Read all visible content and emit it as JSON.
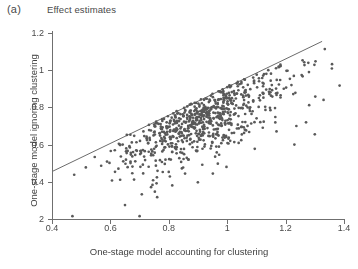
{
  "panel": {
    "label": "(a)",
    "title": "Effect estimates"
  },
  "axes": {
    "x": {
      "title": "One-stage model accounting for clustering",
      "ticks": [
        "0.4",
        "0.6",
        "0.8",
        "1",
        "1.2",
        "1.4"
      ],
      "tick_values": [
        0.4,
        0.6,
        0.8,
        1.0,
        1.2,
        1.4
      ],
      "min": 0.4,
      "max": 1.4
    },
    "y": {
      "title": "One-stage model ignoring clustering",
      "ticks": [
        "1.2",
        "1",
        "0.8",
        "0.6",
        "0.4",
        "2"
      ],
      "tick_values": [
        1.2,
        1.0,
        0.8,
        0.6,
        0.4,
        0.2
      ],
      "min": 0.2,
      "max": 1.2
    }
  },
  "style": {
    "point_color": "#595959",
    "point_radius": 1.35,
    "line_color": "#5a5a5a",
    "axis_color": "#6f6f6f",
    "background": "#ffffff"
  },
  "chart_data": {
    "type": "scatter",
    "title": "Effect estimates",
    "xlabel": "One-stage model accounting for clustering",
    "ylabel": "One-stage model ignoring clustering",
    "xlim": [
      0.4,
      1.4
    ],
    "ylim": [
      0.2,
      1.2
    ],
    "grid": false,
    "legend": null,
    "n_points": 760,
    "reference_line": {
      "label": "identity-like reference line",
      "x_start": 0.4,
      "y_start": 0.455,
      "x_end": 1.325,
      "y_end": 1.155
    },
    "cloud_description": {
      "shape": "dense elongated cluster along and below the reference line, fanning out to the lower right",
      "center_x": 0.9,
      "center_y": 0.76,
      "x_spread": 0.14,
      "y_spread": 0.13,
      "correlation": 0.72,
      "upper_bound": "reference line"
    },
    "outliers": [
      {
        "x": 0.47,
        "y": 0.215
      },
      {
        "x": 0.7,
        "y": 0.215
      },
      {
        "x": 0.65,
        "y": 0.275
      },
      {
        "x": 1.3,
        "y": 0.655
      },
      {
        "x": 1.23,
        "y": 0.6
      },
      {
        "x": 1.27,
        "y": 0.72
      },
      {
        "x": 1.33,
        "y": 0.84
      },
      {
        "x": 1.22,
        "y": 0.92
      },
      {
        "x": 1.28,
        "y": 0.99
      }
    ],
    "series": [
      {
        "name": "trial effect estimates",
        "marker": "filled-circle",
        "color": "#595959"
      }
    ]
  }
}
